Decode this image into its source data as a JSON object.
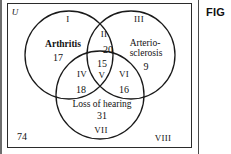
{
  "figure": {
    "caption_fragment": "FIG",
    "universal_set_label": "U",
    "outside_count": "74"
  },
  "sets": [
    {
      "id": "arthritis",
      "name": "Arthritis",
      "count": "17"
    },
    {
      "id": "arteriosclerosis",
      "name_line1": "Arterio-",
      "name_line2": "sclerosis",
      "count": "9"
    },
    {
      "id": "loss-of-hearing",
      "name": "Loss of hearing",
      "count": "31"
    }
  ],
  "regions": [
    {
      "numeral": "I",
      "count": "17",
      "description": "arthritis only"
    },
    {
      "numeral": "II",
      "count": "20",
      "description": "arthritis and arteriosclerosis only"
    },
    {
      "numeral": "III",
      "count": "9",
      "description": "arteriosclerosis only"
    },
    {
      "numeral": "IV",
      "count": "18",
      "description": "arthritis and loss of hearing only"
    },
    {
      "numeral": "V",
      "count": "15",
      "description": "all three"
    },
    {
      "numeral": "VI",
      "count": "16",
      "description": "arteriosclerosis and loss of hearing only"
    },
    {
      "numeral": "VII",
      "count": "31",
      "description": "loss of hearing only"
    },
    {
      "numeral": "VIII",
      "count": "74",
      "description": "none of the three"
    }
  ],
  "labels": {
    "numeral_I": "I",
    "numeral_II": "II",
    "numeral_III": "III",
    "numeral_IV": "IV",
    "numeral_V": "V",
    "numeral_VI": "VI",
    "numeral_VII": "VII",
    "numeral_VIII": "VIII",
    "count_arthritis_only": "17",
    "count_arthritis_arterio": "20",
    "count_arterio_only": "9",
    "count_arthritis_hearing": "18",
    "count_all_three": "15",
    "count_arterio_hearing": "16",
    "count_hearing_only": "31",
    "count_none": "74",
    "name_arthritis": "Arthritis",
    "name_arterio_line1": "Arterio-",
    "name_arterio_line2": "sclerosis",
    "name_hearing": "Loss of hearing"
  },
  "colors": {
    "stroke": "#1a1a1a",
    "text": "#111111",
    "box_border": "#2b2b2b",
    "background": "#ffffff"
  }
}
